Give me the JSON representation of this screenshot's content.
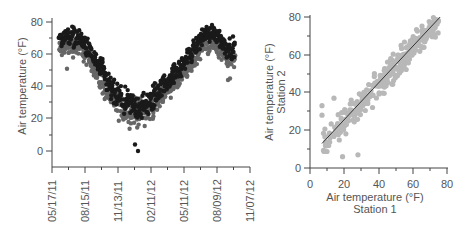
{
  "chart_data": [
    {
      "type": "scatter",
      "title": "",
      "xlabel": "",
      "ylabel": "Air temperature (°F)",
      "ylim": [
        -10,
        80
      ],
      "yticks": [
        0,
        20,
        40,
        60,
        80
      ],
      "xtick_labels": [
        "05/17/11",
        "08/15/11",
        "11/13/11",
        "02/11/12",
        "05/11/12",
        "08/09/12",
        "11/07/12"
      ],
      "grid": false,
      "legend": "none",
      "series": [
        {
          "name": "Station 1",
          "color": "#1a1a1a",
          "description": "Daily air temperature time series, seasonal cycle",
          "approx_points": [
            {
              "date": "06/01/11",
              "value": 68
            },
            {
              "date": "07/01/11",
              "value": 72
            },
            {
              "date": "08/01/11",
              "value": 70
            },
            {
              "date": "09/01/11",
              "value": 60
            },
            {
              "date": "10/01/11",
              "value": 48
            },
            {
              "date": "11/01/11",
              "value": 35
            },
            {
              "date": "12/01/11",
              "value": 30
            },
            {
              "date": "01/01/12",
              "value": 27
            },
            {
              "date": "02/01/12",
              "value": 28
            },
            {
              "date": "03/01/12",
              "value": 38
            },
            {
              "date": "04/01/12",
              "value": 45
            },
            {
              "date": "05/01/12",
              "value": 52
            },
            {
              "date": "06/01/12",
              "value": 62
            },
            {
              "date": "07/01/12",
              "value": 72
            },
            {
              "date": "08/01/12",
              "value": 74
            },
            {
              "date": "09/01/12",
              "value": 64
            }
          ]
        },
        {
          "name": "Station 2",
          "color": "#666666",
          "description": "Daily air temperature time series, slightly cooler",
          "approx_points": [
            {
              "date": "06/01/11",
              "value": 62
            },
            {
              "date": "07/01/11",
              "value": 65
            },
            {
              "date": "08/01/11",
              "value": 64
            },
            {
              "date": "09/01/11",
              "value": 55
            },
            {
              "date": "10/01/11",
              "value": 42
            },
            {
              "date": "11/01/11",
              "value": 30
            },
            {
              "date": "12/01/11",
              "value": 25
            },
            {
              "date": "01/01/12",
              "value": 24
            },
            {
              "date": "02/01/12",
              "value": 25
            },
            {
              "date": "03/01/12",
              "value": 33
            },
            {
              "date": "04/01/12",
              "value": 40
            },
            {
              "date": "05/01/12",
              "value": 45
            },
            {
              "date": "06/01/12",
              "value": 55
            },
            {
              "date": "07/01/12",
              "value": 66
            },
            {
              "date": "08/01/12",
              "value": 66
            },
            {
              "date": "09/01/12",
              "value": 58
            }
          ]
        }
      ]
    },
    {
      "type": "scatter",
      "title": "",
      "xlabel": "Air temperature (°F)",
      "xlabel2": "Station 1",
      "ylabel": "Air temperature (°F)",
      "ylabel2": "Station 2",
      "xlim": [
        0,
        80
      ],
      "ylim": [
        0,
        80
      ],
      "xticks": [
        0,
        20,
        40,
        60,
        80
      ],
      "yticks": [
        0,
        20,
        40,
        60,
        80
      ],
      "grid": false,
      "legend": "none",
      "series": [
        {
          "name": "Station 1 vs Station 2",
          "color": "#b8b8b8",
          "description": "Scatter of paired daily temperatures, strong positive correlation"
        }
      ],
      "fit_line": {
        "x": [
          7,
          76
        ],
        "y": [
          13,
          80
        ],
        "color": "#333333"
      }
    }
  ],
  "left_chart": {
    "y_axis_title": "Air temperature (°F)",
    "y_tick_labels": [
      "80",
      "60",
      "40",
      "20",
      "0"
    ],
    "x_tick_labels": [
      "05/17/11",
      "08/15/11",
      "11/13/11",
      "02/11/12",
      "05/11/12",
      "08/09/12",
      "11/07/12"
    ]
  },
  "right_chart": {
    "y_axis_title_line1": "Air temperature (°F)",
    "y_axis_title_line2": "Station 2",
    "x_axis_title_line1": "Air temperature (°F)",
    "x_axis_title_line2": "Station 1",
    "y_tick_labels": [
      "80",
      "60",
      "40",
      "20",
      "0"
    ],
    "x_tick_labels": [
      "0",
      "20",
      "40",
      "60",
      "80"
    ]
  }
}
